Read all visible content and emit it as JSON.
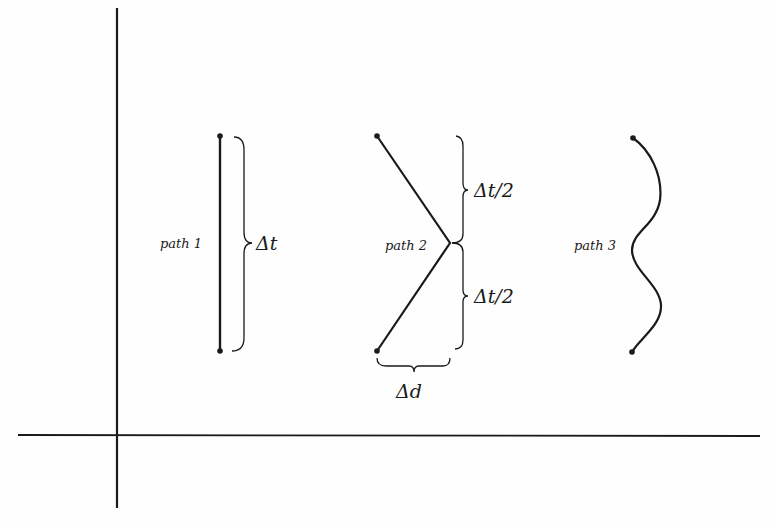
{
  "diagram": {
    "title": "",
    "colors": {
      "ink": "#1a1a1a",
      "background": "#fefefe"
    },
    "axes": {
      "vertical": {
        "x": 117,
        "y1": 8,
        "y2": 508
      },
      "horizontal": {
        "y": 435,
        "x1": 18,
        "x2": 760
      }
    },
    "paths": [
      {
        "name": "path 1",
        "label": "path 1",
        "shape": "straight vertical line",
        "start": [
          220,
          136
        ],
        "end": [
          220,
          351
        ]
      },
      {
        "name": "path 2",
        "label": "path 2",
        "shape": "V (two straight segments)",
        "start": [
          377,
          136
        ],
        "vertex": [
          450,
          243
        ],
        "end": [
          377,
          351
        ]
      },
      {
        "name": "path 3",
        "label": "path 3",
        "shape": "wavy curve",
        "start": [
          633,
          138
        ],
        "end": [
          632,
          352
        ]
      }
    ],
    "annotations": {
      "path1_interval": "Δt",
      "path2_upper_interval": "Δt/2",
      "path2_lower_interval": "Δt/2",
      "path2_horizontal_offset": "Δd"
    }
  }
}
